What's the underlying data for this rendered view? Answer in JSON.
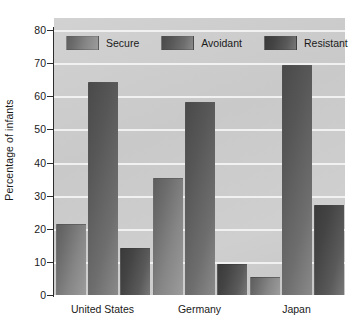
{
  "chart_data": {
    "type": "bar",
    "title": "",
    "xlabel": "",
    "ylabel": "Percentage of infants",
    "ylim": [
      0,
      80
    ],
    "yticks": [
      "0",
      "10",
      "20",
      "30",
      "40",
      "50",
      "60",
      "70",
      "80"
    ],
    "grid": true,
    "legend_position": "inside-top-left",
    "categories": [
      "United States",
      "Germany",
      "Japan"
    ],
    "series": [
      {
        "name": "Secure",
        "values": [
          21,
          35,
          5
        ]
      },
      {
        "name": "Avoidant",
        "values": [
          64,
          58,
          69
        ]
      },
      {
        "name": "Resistant",
        "values": [
          14,
          9,
          27
        ]
      }
    ],
    "colors": {
      "secure": "#7b7b7b",
      "avoidant": "#636363",
      "resistant": "#4a4a4a",
      "plot_background": "#cbcbcb",
      "gridline": "#f2f2f2",
      "axis": "#2c2c2c",
      "text": "#1a1a1a"
    }
  },
  "axis": {
    "y_title": "Percentage of infants",
    "y_ticks": [
      {
        "label": "80",
        "value": 80
      },
      {
        "label": "70",
        "value": 70
      },
      {
        "label": "60",
        "value": 60
      },
      {
        "label": "50",
        "value": 50
      },
      {
        "label": "40",
        "value": 40
      },
      {
        "label": "30",
        "value": 30
      },
      {
        "label": "20",
        "value": 20
      },
      {
        "label": "10",
        "value": 10
      },
      {
        "label": "0",
        "value": 0
      }
    ],
    "x_labels": [
      "United States",
      "Germany",
      "Japan"
    ]
  },
  "legend": {
    "items": [
      {
        "label": "Secure",
        "swatch": "secure-swatch"
      },
      {
        "label": "Avoidant",
        "swatch": "avoidant-swatch"
      },
      {
        "label": "Resistant",
        "swatch": "resistant-swatch"
      }
    ]
  }
}
